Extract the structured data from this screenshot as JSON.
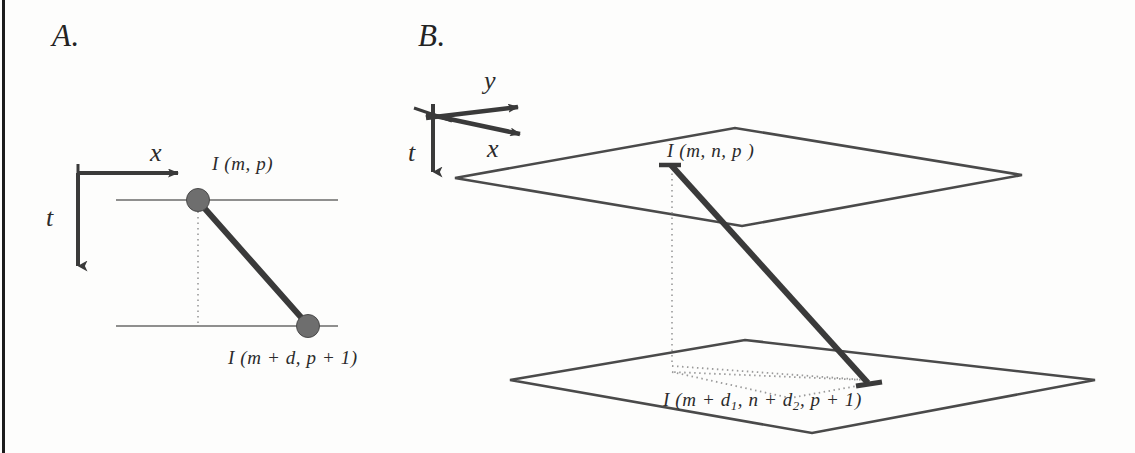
{
  "figure": {
    "background_color": "#fdfdfc",
    "ink_color": "#3a3a3a",
    "node_fill_color": "#6e6e6e",
    "border_color": "#1c1c1c"
  },
  "panels": [
    {
      "id": "A",
      "letter": "A.",
      "description": "2D space-time diagram with x and t axes, two scanlines and a displacement vector",
      "axes": [
        {
          "name": "x",
          "label": "x",
          "direction": "right"
        },
        {
          "name": "t",
          "label": "t",
          "direction": "down"
        }
      ],
      "nodes": [
        {
          "name": "source-pixel",
          "label": "I (m, p)",
          "position": "top"
        },
        {
          "name": "target-pixel",
          "label": "I (m + d, p + 1)",
          "position": "bottom"
        }
      ],
      "lines": [
        {
          "name": "scanline-top",
          "style": "solid-thin"
        },
        {
          "name": "scanline-bottom",
          "style": "solid-thin"
        },
        {
          "name": "displacement-vector",
          "style": "solid-thick"
        },
        {
          "name": "vertical-reference",
          "style": "dotted"
        }
      ]
    },
    {
      "id": "B",
      "letter": "B.",
      "description": "3D space-time diagram with x, y and t axes, two image planes and a displacement vector",
      "axes": [
        {
          "name": "y",
          "label": "y",
          "direction": "up-right"
        },
        {
          "name": "x",
          "label": "x",
          "direction": "down-right"
        },
        {
          "name": "t",
          "label": "t",
          "direction": "down"
        }
      ],
      "nodes": [
        {
          "name": "source-voxel",
          "label": "I (m, n, p )",
          "position": "upper-plane"
        },
        {
          "name": "target-voxel",
          "label_prefix": "I (m + d",
          "label_sub1": "1",
          "label_mid": ", n + d",
          "label_sub2": "2",
          "label_suffix": ", p + 1)",
          "position": "lower-plane"
        }
      ],
      "planes": [
        {
          "name": "upper-image-plane",
          "style": "solid-thin-parallelogram"
        },
        {
          "name": "lower-image-plane",
          "style": "solid-thin-parallelogram"
        }
      ],
      "lines": [
        {
          "name": "displacement-vector",
          "style": "solid-thick"
        },
        {
          "name": "vertical-reference",
          "style": "dotted"
        },
        {
          "name": "projection-path",
          "style": "dotted"
        }
      ]
    }
  ]
}
